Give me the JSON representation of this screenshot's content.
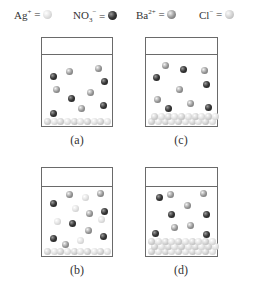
{
  "legend": [
    {
      "symbol": "Ag",
      "charge": "+",
      "sub": "",
      "eq": "=",
      "ion": "ag"
    },
    {
      "symbol": "NO",
      "charge": "−",
      "sub": "3",
      "eq": "=",
      "ion": "no3"
    },
    {
      "symbol": "Ba",
      "charge": "2+",
      "sub": "",
      "eq": "=",
      "ion": "ba"
    },
    {
      "symbol": "Cl",
      "charge": "−",
      "sub": "",
      "eq": "=",
      "ion": "cl"
    }
  ],
  "beakers": [
    {
      "label": "(a)",
      "box": {
        "x": 41,
        "y": 37,
        "w": 72,
        "h": 90
      },
      "air_height": 16,
      "particles": [
        {
          "t": "no3",
          "x": 8,
          "y": 25
        },
        {
          "t": "ba",
          "x": 24,
          "y": 20
        },
        {
          "t": "ba",
          "x": 53,
          "y": 17
        },
        {
          "t": "no3",
          "x": 59,
          "y": 30
        },
        {
          "t": "ba",
          "x": 11,
          "y": 38
        },
        {
          "t": "ba",
          "x": 45,
          "y": 41
        },
        {
          "t": "no3",
          "x": 26,
          "y": 47
        },
        {
          "t": "ba",
          "x": 36,
          "y": 57
        },
        {
          "t": "no3",
          "x": 58,
          "y": 54
        },
        {
          "t": "no3",
          "x": 8,
          "y": 62
        }
      ],
      "precipitate": {
        "type": "cl",
        "rows": 1,
        "count": 5
      }
    },
    {
      "label": "(c)",
      "box": {
        "x": 145,
        "y": 37,
        "w": 73,
        "h": 90
      },
      "air_height": 16,
      "particles": [
        {
          "t": "ba",
          "x": 16,
          "y": 14
        },
        {
          "t": "no3",
          "x": 34,
          "y": 18
        },
        {
          "t": "ba",
          "x": 55,
          "y": 19
        },
        {
          "t": "no3",
          "x": 7,
          "y": 26
        },
        {
          "t": "no3",
          "x": 57,
          "y": 33
        },
        {
          "t": "ba",
          "x": 30,
          "y": 38
        },
        {
          "t": "ba",
          "x": 8,
          "y": 48
        },
        {
          "t": "ba",
          "x": 41,
          "y": 52
        },
        {
          "t": "no3",
          "x": 19,
          "y": 57
        },
        {
          "t": "no3",
          "x": 59,
          "y": 56
        }
      ],
      "precipitate": {
        "type": "cl",
        "rows": 2,
        "count": 5
      }
    },
    {
      "label": "(b)",
      "box": {
        "x": 41,
        "y": 167,
        "w": 72,
        "h": 90
      },
      "air_height": 18,
      "particles": [
        {
          "t": "ba",
          "x": 24,
          "y": 11
        },
        {
          "t": "ag",
          "x": 40,
          "y": 14
        },
        {
          "t": "ba",
          "x": 55,
          "y": 10
        },
        {
          "t": "no3",
          "x": 8,
          "y": 20
        },
        {
          "t": "ag",
          "x": 30,
          "y": 25
        },
        {
          "t": "no3",
          "x": 59,
          "y": 28
        },
        {
          "t": "ba",
          "x": 44,
          "y": 30
        },
        {
          "t": "ag",
          "x": 12,
          "y": 38
        },
        {
          "t": "no3",
          "x": 27,
          "y": 40
        },
        {
          "t": "ag",
          "x": 56,
          "y": 36
        },
        {
          "t": "ba",
          "x": 43,
          "y": 47
        },
        {
          "t": "no3",
          "x": 8,
          "y": 55
        },
        {
          "t": "ba",
          "x": 20,
          "y": 61
        },
        {
          "t": "ag",
          "x": 35,
          "y": 57
        },
        {
          "t": "no3",
          "x": 58,
          "y": 53
        }
      ],
      "precipitate": {
        "type": "cl",
        "rows": 1,
        "count": 5
      }
    },
    {
      "label": "(d)",
      "box": {
        "x": 145,
        "y": 167,
        "w": 73,
        "h": 90
      },
      "air_height": 18,
      "particles": [
        {
          "t": "no3",
          "x": 10,
          "y": 14
        },
        {
          "t": "ba",
          "x": 21,
          "y": 11
        },
        {
          "t": "ba",
          "x": 54,
          "y": 10
        },
        {
          "t": "ba",
          "x": 38,
          "y": 22
        },
        {
          "t": "no3",
          "x": 22,
          "y": 31
        },
        {
          "t": "no3",
          "x": 57,
          "y": 31
        },
        {
          "t": "ba",
          "x": 25,
          "y": 44
        },
        {
          "t": "ba",
          "x": 41,
          "y": 42
        },
        {
          "t": "no3",
          "x": 6,
          "y": 50
        },
        {
          "t": "no3",
          "x": 57,
          "y": 51
        }
      ],
      "precipitate": {
        "type": "cl",
        "rows": 3,
        "count": 6
      }
    }
  ],
  "label_positions": [
    {
      "x": 57,
      "y": 133
    },
    {
      "x": 161,
      "y": 133
    },
    {
      "x": 57,
      "y": 263
    },
    {
      "x": 161,
      "y": 263
    }
  ]
}
